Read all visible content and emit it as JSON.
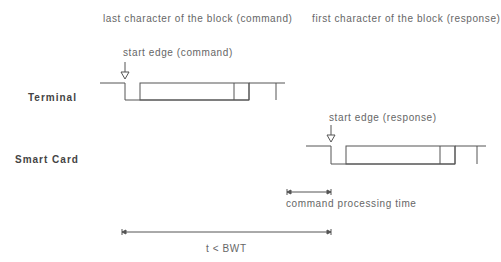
{
  "diagram": {
    "headings": {
      "command": "last character of the block (command)",
      "response": "first character of the block (response)"
    },
    "rows": {
      "terminal": "Terminal",
      "card": "Smart Card"
    },
    "annotations": {
      "start_command": "start edge (command)",
      "start_response": "start edge (response)",
      "processing": "command processing time",
      "bwt": "t < BWT"
    },
    "colors": {
      "line": "#555555",
      "text": "#666666"
    }
  }
}
